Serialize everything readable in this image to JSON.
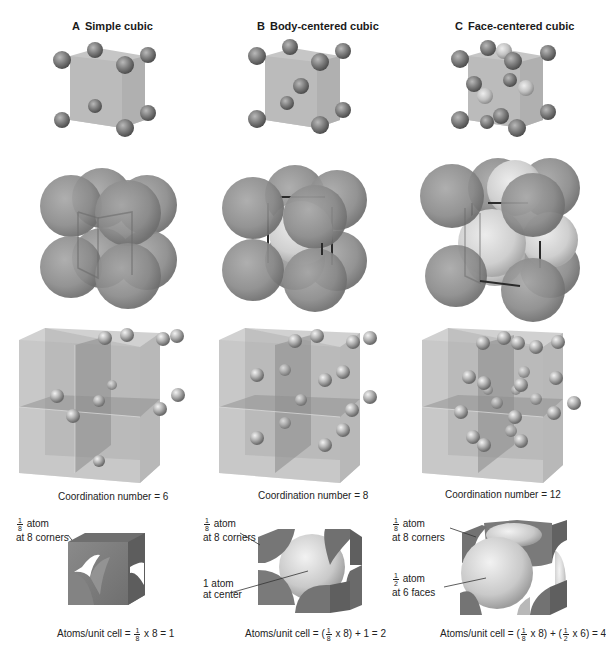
{
  "figure": {
    "columns": [
      {
        "letter": "A",
        "title": "Simple cubic",
        "coordination_caption": "Coordination number = 6",
        "coordination_number": 6,
        "atoms_per_cell_caption": {
          "prefix": "Atoms/unit cell = ",
          "frac1_num": "1",
          "frac1_den": "8",
          "suffix": " x 8 = 1"
        },
        "atoms_per_cell": 1,
        "callouts": [
          {
            "frac_num": "1",
            "frac_den": "8",
            "line1": " atom",
            "line2": "at 8 corners"
          }
        ]
      },
      {
        "letter": "B",
        "title": "Body-centered cubic",
        "coordination_caption": "Coordination number = 8",
        "coordination_number": 8,
        "atoms_per_cell_caption": {
          "prefix": "Atoms/unit cell = (",
          "frac1_num": "1",
          "frac1_den": "8",
          "suffix": " x 8) + 1 = 2"
        },
        "atoms_per_cell": 2,
        "callouts": [
          {
            "frac_num": "1",
            "frac_den": "8",
            "line1": " atom",
            "line2": "at 8 corners"
          },
          {
            "line1": "1 atom",
            "line2": "at center"
          }
        ]
      },
      {
        "letter": "C",
        "title": "Face-centered cubic",
        "coordination_caption": "Coordination number = 12",
        "coordination_number": 12,
        "atoms_per_cell_caption": {
          "prefix": "Atoms/unit cell = (",
          "frac1_num": "1",
          "frac1_den": "8",
          "mid": " x 8) + (",
          "frac2_num": "1",
          "frac2_den": "2",
          "suffix": " x 6) = 4"
        },
        "atoms_per_cell": 4,
        "callouts": [
          {
            "frac_num": "1",
            "frac_den": "8",
            "line1": " atom",
            "line2": "at 8 corners"
          },
          {
            "frac_num": "1",
            "frac_den": "2",
            "line1": " atom",
            "line2": "at 6 faces"
          }
        ]
      }
    ],
    "colors": {
      "atom": "#7a7a7a",
      "atom_highlight": "#c8c8c8",
      "atom_light": "#d6d6d6",
      "cube_fill": "#bdbdbd",
      "cube_dark": "#8f8f8f",
      "edge": "#2a2a2a"
    }
  }
}
